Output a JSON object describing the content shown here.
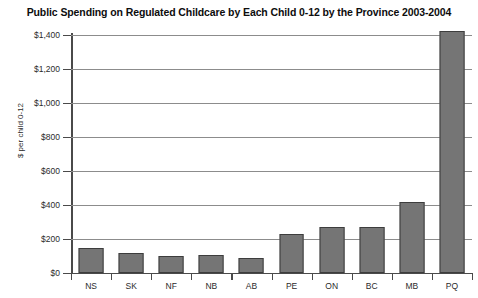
{
  "chart_data": {
    "type": "bar",
    "title": "Public Spending on Regulated Childcare by Each Child 0-12 by the Province 2003-2004",
    "xlabel": "",
    "ylabel": "$ per child 0-12",
    "categories": [
      "NS",
      "SK",
      "NF",
      "NB",
      "AB",
      "PE",
      "ON",
      "BC",
      "MB",
      "PQ"
    ],
    "values": [
      150,
      115,
      100,
      105,
      90,
      230,
      270,
      270,
      415,
      1425
    ],
    "ylim": [
      0,
      1400
    ],
    "ytick_values": [
      0,
      200,
      400,
      600,
      800,
      1000,
      1200,
      1400
    ],
    "ytick_labels": [
      "$0",
      "$200",
      "$400",
      "$600",
      "$800",
      "$1,000",
      "$1,200",
      "$1,400"
    ],
    "grid": true,
    "legend": false,
    "bar_color": "#757575",
    "bar_border_color": "#3d3d3d",
    "gridline_color": "#8c8c8c",
    "axis_color": "#4a4a4a",
    "background_color": "#ffffff"
  }
}
